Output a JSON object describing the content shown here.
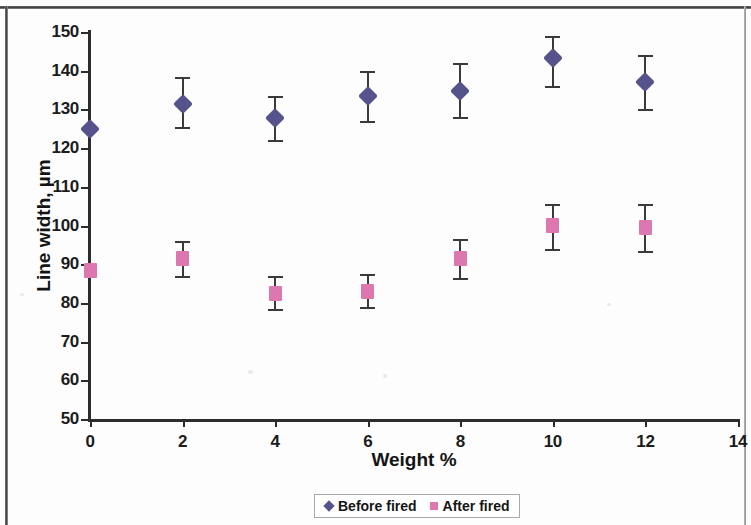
{
  "chart_data": {
    "type": "scatter",
    "title": "",
    "xlabel": "Weight %",
    "ylabel": "Line width, µm",
    "xlim": [
      0,
      14
    ],
    "ylim": [
      50,
      150
    ],
    "xticks": [
      0,
      2,
      4,
      6,
      8,
      10,
      12,
      14
    ],
    "yticks": [
      50,
      60,
      70,
      80,
      90,
      100,
      110,
      120,
      130,
      140,
      150
    ],
    "grid": false,
    "legend_position": "bottom-center",
    "x": [
      0,
      2,
      4,
      6,
      8,
      10,
      12
    ],
    "series": [
      {
        "name": "Before fired",
        "marker": "diamond",
        "color": "#55528c",
        "values": [
          125,
          131.5,
          127.8,
          133.5,
          134.8,
          143.2,
          137
        ],
        "err_low": [
          125,
          125.5,
          122,
          127,
          128,
          136,
          130
        ],
        "err_high": [
          125,
          138.5,
          133.5,
          140,
          142,
          149,
          144
        ]
      },
      {
        "name": "After fired",
        "marker": "square",
        "color": "#dd77b0",
        "values": [
          88.5,
          91.5,
          82.5,
          83,
          91.5,
          100,
          99.5
        ],
        "err_low": [
          88.5,
          87,
          78.5,
          79,
          86.5,
          94,
          93.5
        ],
        "err_high": [
          88.5,
          96,
          87,
          87.5,
          96.5,
          105.5,
          105.5
        ]
      }
    ]
  },
  "legend": {
    "entries": [
      {
        "label": "Before fired",
        "key": "diamond-marker-icon"
      },
      {
        "label": "After fired",
        "key": "square-marker-icon"
      }
    ]
  },
  "axes": {
    "x_title": "Weight %",
    "y_title": "Line width, µm",
    "x_tick_labels": [
      "0",
      "2",
      "4",
      "6",
      "8",
      "10",
      "12",
      "14"
    ],
    "y_tick_labels": [
      "50",
      "60",
      "70",
      "80",
      "90",
      "100",
      "110",
      "120",
      "130",
      "140",
      "150"
    ]
  },
  "colors": {
    "before_fired": "#55528c",
    "after_fired": "#dd77b0",
    "axis": "#2d2b2e",
    "text": "#141414"
  }
}
